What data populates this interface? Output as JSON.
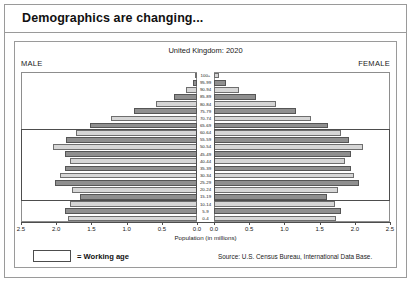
{
  "slide": {
    "title": "Demographics are changing..."
  },
  "footer": {
    "legend_label": "= Working age",
    "source": "Source: U.S. Census Bureau, International Data Base."
  },
  "chart_data": {
    "type": "bar",
    "subtype": "population-pyramid",
    "title": "United Kingdom: 2020",
    "xlabel": "Population (in millions)",
    "ylabel": "",
    "left_label": "MALE",
    "right_label": "FEMALE",
    "xlim": [
      0,
      2.5
    ],
    "xticks": [
      2.5,
      2.0,
      1.5,
      1.0,
      0.5,
      0.0
    ],
    "xticklabels": [
      "2.5",
      "2.0",
      "1.5",
      "1.0",
      "0.5",
      "0.0"
    ],
    "grid": false,
    "legend_position": "below",
    "working_age_range": [
      "15-19",
      "60-64"
    ],
    "categories": [
      "100+",
      "95-99",
      "90-94",
      "85-89",
      "80-84",
      "75-79",
      "70-74",
      "65-69",
      "60-64",
      "55-59",
      "50-54",
      "45-49",
      "40-44",
      "35-39",
      "30-34",
      "25-29",
      "20-24",
      "15-19",
      "10-14",
      "5-9",
      "0-4"
    ],
    "series": [
      {
        "name": "MALE",
        "side": "left",
        "values": [
          0.02,
          0.06,
          0.16,
          0.32,
          0.58,
          0.9,
          1.22,
          1.52,
          1.72,
          1.86,
          2.05,
          1.88,
          1.8,
          1.88,
          1.94,
          2.02,
          1.78,
          1.66,
          1.8,
          1.88,
          1.83
        ]
      },
      {
        "name": "FEMALE",
        "side": "right",
        "values": [
          0.07,
          0.17,
          0.36,
          0.6,
          0.88,
          1.16,
          1.38,
          1.62,
          1.8,
          1.92,
          2.12,
          1.95,
          1.86,
          1.94,
          1.99,
          2.06,
          1.76,
          1.6,
          1.72,
          1.8,
          1.74
        ]
      }
    ]
  }
}
